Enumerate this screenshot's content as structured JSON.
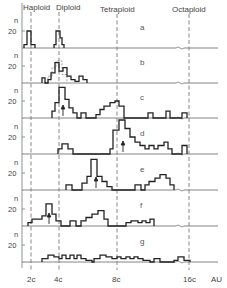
{
  "chart_data": {
    "type": "histogram-stack",
    "title": "",
    "xlabel": "AU",
    "ylabel": "n",
    "x_ticks": [
      "2c",
      "4c",
      "8c",
      "16c"
    ],
    "x_unit_label": "AU",
    "y_tick": "20",
    "reference_lines": [
      {
        "label": "Haploid",
        "at": "2c"
      },
      {
        "label": "Diploid",
        "at": "4c"
      },
      {
        "label": "Tetraploid",
        "at": "8c"
      },
      {
        "label": "Octaploid",
        "at": "16c"
      }
    ],
    "grid": false,
    "panels": [
      {
        "label": "a",
        "bins_note": "narrow peaks at haploid (2c) and diploid (4c)",
        "steps": [
          [
            24,
            0
          ],
          [
            24,
            4
          ],
          [
            27,
            4
          ],
          [
            27,
            20
          ],
          [
            31,
            20
          ],
          [
            31,
            4
          ],
          [
            35,
            4
          ],
          [
            35,
            0
          ]
        ],
        "steps2": [
          [
            54,
            0
          ],
          [
            54,
            4
          ],
          [
            56,
            4
          ],
          [
            56,
            20
          ],
          [
            60,
            20
          ],
          [
            60,
            12
          ],
          [
            62,
            12
          ],
          [
            62,
            4
          ],
          [
            64,
            4
          ],
          [
            64,
            0
          ]
        ]
      },
      {
        "label": "b",
        "bins_note": "diploid peak with shoulder; dashed overlay histogram",
        "steps": [
          [
            42,
            0
          ],
          [
            42,
            6
          ],
          [
            45,
            6
          ],
          [
            45,
            0
          ],
          [
            48,
            0
          ],
          [
            48,
            4
          ],
          [
            51,
            4
          ],
          [
            51,
            12
          ],
          [
            55,
            12
          ],
          [
            55,
            24
          ],
          [
            59,
            24
          ],
          [
            59,
            14
          ],
          [
            63,
            14
          ],
          [
            63,
            18
          ],
          [
            67,
            18
          ],
          [
            67,
            8
          ],
          [
            71,
            8
          ],
          [
            71,
            4
          ],
          [
            75,
            4
          ],
          [
            75,
            2
          ],
          [
            79,
            2
          ],
          [
            79,
            8
          ],
          [
            83,
            8
          ],
          [
            83,
            4
          ],
          [
            87,
            4
          ],
          [
            87,
            0
          ]
        ],
        "dashed": [
          [
            48,
            0
          ],
          [
            48,
            8
          ],
          [
            52,
            8
          ],
          [
            52,
            18
          ],
          [
            56,
            18
          ],
          [
            56,
            26
          ],
          [
            62,
            26
          ],
          [
            62,
            10
          ],
          [
            67,
            10
          ],
          [
            67,
            0
          ]
        ]
      },
      {
        "label": "c",
        "bins_note": "strong diploid peak, small tetraploid cluster, sparse high counts; arrow near 4c",
        "steps": [
          [
            52,
            0
          ],
          [
            52,
            8
          ],
          [
            55,
            8
          ],
          [
            55,
            18
          ],
          [
            59,
            18
          ],
          [
            59,
            36
          ],
          [
            65,
            36
          ],
          [
            65,
            22
          ],
          [
            69,
            22
          ],
          [
            69,
            12
          ],
          [
            73,
            12
          ],
          [
            73,
            6
          ],
          [
            77,
            6
          ],
          [
            77,
            0
          ],
          [
            81,
            0
          ],
          [
            81,
            6
          ],
          [
            86,
            6
          ],
          [
            86,
            0
          ],
          [
            96,
            0
          ],
          [
            96,
            4
          ],
          [
            100,
            4
          ],
          [
            100,
            10
          ],
          [
            104,
            10
          ],
          [
            104,
            14
          ],
          [
            110,
            14
          ],
          [
            110,
            18
          ],
          [
            115,
            18
          ],
          [
            115,
            20
          ],
          [
            119,
            20
          ],
          [
            119,
            14
          ],
          [
            124,
            14
          ],
          [
            124,
            0
          ],
          [
            148,
            0
          ],
          [
            148,
            6
          ],
          [
            153,
            6
          ],
          [
            153,
            0
          ],
          [
            166,
            0
          ],
          [
            166,
            8
          ],
          [
            170,
            8
          ],
          [
            170,
            0
          ],
          [
            182,
            0
          ],
          [
            182,
            6
          ],
          [
            187,
            6
          ],
          [
            187,
            0
          ]
        ],
        "arrow_x": 63
      },
      {
        "label": "d",
        "bins_note": "small diploid bump, main tetraploid peak with tail, bar near 16c; arrow near 8c",
        "steps": [
          [
            58,
            0
          ],
          [
            58,
            6
          ],
          [
            62,
            6
          ],
          [
            62,
            12
          ],
          [
            68,
            12
          ],
          [
            68,
            6
          ],
          [
            73,
            6
          ],
          [
            73,
            0
          ],
          [
            110,
            0
          ],
          [
            110,
            6
          ],
          [
            113,
            6
          ],
          [
            113,
            28
          ],
          [
            119,
            28
          ],
          [
            119,
            40
          ],
          [
            125,
            40
          ],
          [
            125,
            30
          ],
          [
            130,
            30
          ],
          [
            130,
            20
          ],
          [
            135,
            20
          ],
          [
            135,
            14
          ],
          [
            140,
            14
          ],
          [
            140,
            10
          ],
          [
            145,
            10
          ],
          [
            145,
            6
          ],
          [
            149,
            6
          ],
          [
            149,
            10
          ],
          [
            154,
            10
          ],
          [
            154,
            6
          ],
          [
            158,
            6
          ],
          [
            158,
            10
          ],
          [
            164,
            10
          ],
          [
            164,
            14
          ],
          [
            168,
            14
          ],
          [
            168,
            6
          ],
          [
            172,
            6
          ],
          [
            172,
            0
          ],
          [
            182,
            0
          ],
          [
            182,
            10
          ],
          [
            187,
            10
          ],
          [
            187,
            0
          ]
        ],
        "arrow_x": 123
      },
      {
        "label": "e",
        "bins_note": "sparse diploid, main peak between 4c and 8c, broad cluster between 8c and 16c; arrow at peak",
        "steps": [
          [
            66,
            0
          ],
          [
            66,
            6
          ],
          [
            72,
            6
          ],
          [
            72,
            0
          ],
          [
            82,
            0
          ],
          [
            82,
            8
          ],
          [
            87,
            8
          ],
          [
            87,
            16
          ],
          [
            91,
            16
          ],
          [
            91,
            36
          ],
          [
            97,
            36
          ],
          [
            97,
            16
          ],
          [
            102,
            16
          ],
          [
            102,
            10
          ],
          [
            107,
            10
          ],
          [
            107,
            4
          ],
          [
            112,
            4
          ],
          [
            112,
            0
          ],
          [
            135,
            0
          ],
          [
            135,
            6
          ],
          [
            141,
            6
          ],
          [
            141,
            0
          ],
          [
            145,
            0
          ],
          [
            145,
            6
          ],
          [
            149,
            6
          ],
          [
            149,
            10
          ],
          [
            155,
            10
          ],
          [
            155,
            14
          ],
          [
            160,
            14
          ],
          [
            160,
            18
          ],
          [
            166,
            18
          ],
          [
            166,
            14
          ],
          [
            170,
            14
          ],
          [
            170,
            6
          ],
          [
            174,
            6
          ],
          [
            174,
            0
          ]
        ],
        "arrow_x": 96
      },
      {
        "label": "f",
        "bins_note": "peak between 2c and 4c, cluster between 4c and 8c, small cluster beyond 8c; arrow at first peak",
        "steps": [
          [
            28,
            0
          ],
          [
            28,
            4
          ],
          [
            32,
            4
          ],
          [
            32,
            8
          ],
          [
            42,
            8
          ],
          [
            42,
            12
          ],
          [
            46,
            12
          ],
          [
            46,
            26
          ],
          [
            52,
            26
          ],
          [
            52,
            14
          ],
          [
            56,
            14
          ],
          [
            56,
            6
          ],
          [
            61,
            6
          ],
          [
            61,
            0
          ],
          [
            70,
            0
          ],
          [
            70,
            6
          ],
          [
            76,
            6
          ],
          [
            76,
            0
          ],
          [
            81,
            0
          ],
          [
            81,
            6
          ],
          [
            86,
            6
          ],
          [
            86,
            10
          ],
          [
            92,
            10
          ],
          [
            92,
            14
          ],
          [
            98,
            14
          ],
          [
            98,
            18
          ],
          [
            104,
            18
          ],
          [
            104,
            8
          ],
          [
            108,
            8
          ],
          [
            108,
            0
          ],
          [
            126,
            0
          ],
          [
            126,
            4
          ],
          [
            131,
            4
          ],
          [
            131,
            6
          ],
          [
            138,
            6
          ],
          [
            138,
            4
          ],
          [
            142,
            4
          ],
          [
            142,
            6
          ],
          [
            146,
            6
          ],
          [
            146,
            4
          ],
          [
            150,
            4
          ],
          [
            150,
            8
          ],
          [
            154,
            8
          ],
          [
            154,
            0
          ]
        ],
        "arrow_x": 49
      },
      {
        "label": "g",
        "bins_note": "low, broad distribution spanning 4c to 16c",
        "steps": [
          [
            42,
            0
          ],
          [
            42,
            4
          ],
          [
            48,
            4
          ],
          [
            48,
            8
          ],
          [
            54,
            8
          ],
          [
            54,
            6
          ],
          [
            59,
            6
          ],
          [
            59,
            4
          ],
          [
            62,
            4
          ],
          [
            62,
            8
          ],
          [
            66,
            8
          ],
          [
            66,
            4
          ],
          [
            70,
            4
          ],
          [
            70,
            8
          ],
          [
            74,
            8
          ],
          [
            74,
            4
          ],
          [
            77,
            4
          ],
          [
            77,
            8
          ],
          [
            81,
            8
          ],
          [
            81,
            4
          ],
          [
            86,
            4
          ],
          [
            86,
            2
          ],
          [
            92,
            2
          ],
          [
            92,
            0
          ],
          [
            94,
            0
          ],
          [
            94,
            4
          ],
          [
            100,
            4
          ],
          [
            100,
            8
          ],
          [
            106,
            8
          ],
          [
            106,
            6
          ],
          [
            112,
            6
          ],
          [
            112,
            4
          ],
          [
            117,
            4
          ],
          [
            117,
            6
          ],
          [
            121,
            6
          ],
          [
            121,
            4
          ],
          [
            126,
            4
          ],
          [
            126,
            6
          ],
          [
            130,
            6
          ],
          [
            130,
            4
          ],
          [
            134,
            4
          ],
          [
            134,
            6
          ],
          [
            138,
            6
          ],
          [
            138,
            4
          ],
          [
            143,
            4
          ],
          [
            143,
            2
          ],
          [
            150,
            2
          ],
          [
            150,
            0
          ],
          [
            154,
            0
          ],
          [
            154,
            4
          ],
          [
            160,
            4
          ],
          [
            160,
            0
          ],
          [
            174,
            0
          ],
          [
            174,
            2
          ],
          [
            178,
            2
          ],
          [
            178,
            6
          ],
          [
            184,
            6
          ],
          [
            184,
            2
          ],
          [
            190,
            2
          ],
          [
            190,
            0
          ]
        ]
      }
    ],
    "layout": {
      "ylim_per_panel": [
        0,
        40
      ],
      "legend": "none",
      "panel_baselines_px": [
        48,
        83,
        118,
        154,
        190,
        226,
        262
      ]
    }
  },
  "labels": {
    "ref_haploid": "Haploid",
    "ref_diploid": "Diploid",
    "ref_tetraploid": "Tetraploid",
    "ref_octaploid": "Octaploid",
    "y_name": "n",
    "y_tick": "20",
    "x_2c": "2c",
    "x_4c": "4c",
    "x_8c": "8c",
    "x_16c": "16c",
    "x_unit": "AU",
    "panel_a": "a",
    "panel_b": "b",
    "panel_c": "c",
    "panel_d": "d",
    "panel_e": "e",
    "panel_f": "f",
    "panel_g": "g"
  }
}
